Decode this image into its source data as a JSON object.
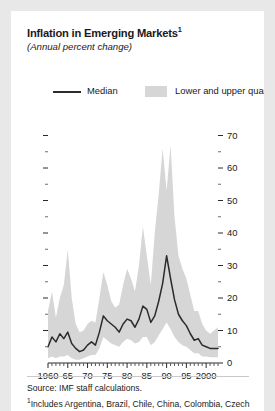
{
  "figure": {
    "title": "Inflation in Emerging Markets",
    "title_footnote_marker": "1",
    "subtitle": "(Annual percent change)",
    "source_line": "Source: IMF staff calculations.",
    "footnote_marker": "1",
    "footnote_text": "Includes Argentina, Brazil, Chile, China, Colombia, Czech",
    "colors": {
      "band": "#d6d6d6",
      "median_line": "#2b2b2b",
      "page_background": "#e8e8e8",
      "panel_background": "#ffffff",
      "text": "#1a1a1a"
    }
  },
  "legend": {
    "position": "top",
    "entries": [
      {
        "label": "Median",
        "marker": "line",
        "color": "#2b2b2b"
      },
      {
        "label": "Lower and upper quartiles",
        "marker": "band",
        "color": "#d6d6d6"
      }
    ]
  },
  "chart_data": {
    "type": "area",
    "title": "Inflation in Emerging Markets",
    "subtitle": "(Annual percent change)",
    "xlabel": "",
    "ylabel": "",
    "xlim": [
      1960,
      2003
    ],
    "ylim": [
      0,
      72
    ],
    "y_axis_side": "right",
    "y_ticks_major": [
      0,
      10,
      20,
      30,
      40,
      50,
      60,
      70
    ],
    "y_ticks_minor": [
      5,
      15,
      25,
      35,
      45,
      55,
      65
    ],
    "y_tick_labels": [
      "0",
      "10",
      "20",
      "30",
      "40",
      "50",
      "60",
      "70"
    ],
    "x_ticks_major": [
      1960,
      1965,
      1970,
      1975,
      1980,
      1985,
      1990,
      1995,
      2000
    ],
    "x_tick_labels": [
      "1960",
      "65",
      "70",
      "75",
      "80",
      "85",
      "90",
      "95",
      "2000"
    ],
    "x_tick_minor_interval": 1,
    "grid": false,
    "x": [
      1960,
      1961,
      1962,
      1963,
      1964,
      1965,
      1966,
      1967,
      1968,
      1969,
      1970,
      1971,
      1972,
      1973,
      1974,
      1975,
      1976,
      1977,
      1978,
      1979,
      1980,
      1981,
      1982,
      1983,
      1984,
      1985,
      1986,
      1987,
      1988,
      1989,
      1990,
      1991,
      1992,
      1993,
      1994,
      1995,
      1996,
      1997,
      1998,
      1999,
      2000,
      2001,
      2002,
      2003
    ],
    "series": [
      {
        "name": "Median",
        "type": "line",
        "color": "#2b2b2b",
        "values": [
          5.0,
          8.0,
          6.5,
          9.0,
          7.5,
          9.5,
          6.0,
          4.5,
          3.5,
          4.0,
          5.5,
          6.5,
          5.5,
          9.5,
          14.5,
          13.0,
          12.0,
          11.0,
          9.5,
          12.0,
          13.5,
          13.0,
          11.0,
          13.5,
          17.5,
          16.5,
          12.5,
          14.5,
          19.0,
          24.5,
          33.0,
          26.0,
          19.5,
          15.0,
          13.0,
          11.5,
          9.0,
          7.0,
          7.5,
          5.5,
          5.0,
          4.5,
          4.5,
          4.5
        ]
      },
      {
        "name": "Lower quartile",
        "type": "band_lower",
        "color": "#d6d6d6",
        "values": [
          1.5,
          2.0,
          1.5,
          2.0,
          2.0,
          2.5,
          1.5,
          1.0,
          1.0,
          1.5,
          2.0,
          2.5,
          2.5,
          4.5,
          8.0,
          7.0,
          6.0,
          5.5,
          5.0,
          6.5,
          7.5,
          7.0,
          6.0,
          6.5,
          8.0,
          8.0,
          5.5,
          6.5,
          8.5,
          10.5,
          12.5,
          10.5,
          8.0,
          6.5,
          5.5,
          5.0,
          4.0,
          3.0,
          3.0,
          2.0,
          2.0,
          1.8,
          1.8,
          1.8
        ]
      },
      {
        "name": "Upper quartile",
        "type": "band_upper",
        "color": "#d6d6d6",
        "values": [
          16.0,
          22.0,
          14.0,
          20.0,
          24.0,
          35.0,
          20.0,
          12.0,
          9.5,
          10.0,
          12.0,
          13.0,
          12.5,
          20.0,
          28.0,
          24.0,
          19.0,
          17.0,
          18.0,
          24.0,
          29.0,
          26.0,
          22.0,
          30.0,
          42.0,
          33.0,
          24.0,
          40.0,
          52.0,
          66.0,
          53.0,
          67.0,
          45.0,
          33.0,
          29.0,
          26.0,
          21.0,
          16.0,
          16.0,
          12.0,
          10.0,
          9.0,
          10.0,
          11.0
        ]
      }
    ]
  }
}
